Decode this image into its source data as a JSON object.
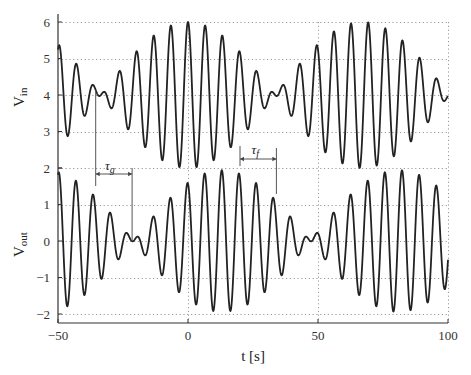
{
  "chart_data": {
    "type": "line",
    "title": "",
    "xlabel": "t [s]",
    "xlim": [
      -50,
      100
    ],
    "x_ticks": [
      -50,
      0,
      50,
      100
    ],
    "x_tick_labels": [
      "−50",
      "0",
      "50",
      "100"
    ],
    "grid": true,
    "panels": [
      {
        "name": "input",
        "ylabel": "V",
        "ylabel_sub": "in",
        "ylim": [
          2,
          6
        ],
        "y_ticks": [
          2,
          3,
          4,
          5,
          6
        ],
        "y_tick_labels": [
          "2",
          "3",
          "4",
          "5",
          "6"
        ],
        "series": {
          "name": "Vin",
          "model": "offset + a*(cos(w1*(t - delay)) + cos(w2*(t - delay)))",
          "offset": 4,
          "amplitude_each": 1,
          "carrier_period_s": 6.6,
          "envelope_null_times_s": [
            -33.5,
            33.5
          ],
          "envelope_max_times_s": [
            0,
            67
          ],
          "delay_s": 0
        }
      },
      {
        "name": "output",
        "ylabel": "V",
        "ylabel_sub": "out",
        "ylim": [
          -2,
          2
        ],
        "y_ticks": [
          -2,
          -1,
          0,
          1,
          2
        ],
        "y_tick_labels": [
          "−2",
          "−1",
          "0",
          "1",
          "2"
        ],
        "series": {
          "name": "Vout",
          "model": "offset + a*(cos(w1*(t - tau_f)) + cos(w2*(t - tau_g)))",
          "offset": 0,
          "amplitude_each": 0.97,
          "carrier_period_s": 6.6,
          "envelope_null_times_s": [
            -21,
            47
          ],
          "envelope_max_times_s": [
            13,
            80
          ]
        }
      }
    ],
    "annotations": [
      {
        "label": "τ",
        "sub": "g",
        "name": "group-delay",
        "from_t": -35.5,
        "to_t": -21.5,
        "description": "group delay between envelope nulls of Vin and Vout"
      },
      {
        "label": "τ",
        "sub": "f",
        "name": "phase-delay",
        "from_t": 20,
        "to_t": 34,
        "description": "phase delay between carrier peaks of Vin and Vout"
      }
    ]
  }
}
